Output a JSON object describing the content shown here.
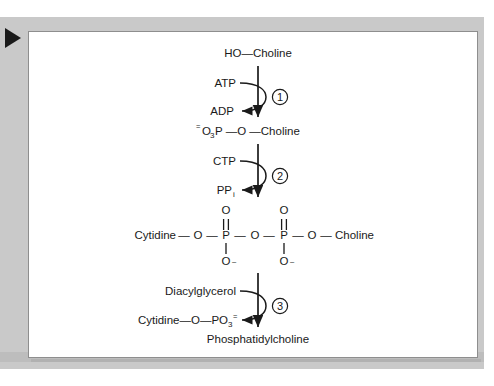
{
  "figure": {
    "marker": "play-triangle",
    "background_color": "#c9c9c9",
    "panel_color": "#ffffff",
    "ink_color": "#1a1a1a"
  },
  "pathway": {
    "title": "Phosphatidylcholine biosynthesis",
    "nodes": [
      {
        "id": "choline",
        "text": "HO—Choline"
      },
      {
        "id": "phosphocholine",
        "prefix_charge": "=",
        "text_main": "O",
        "sub": "3",
        "text_rest": "P —O —Choline"
      },
      {
        "id": "cdp_choline",
        "text": "Cytidine—O—P—O—P—O—Choline"
      },
      {
        "id": "product",
        "text": "Phosphatidylcholine"
      }
    ],
    "cdp_choline_atoms": {
      "left_label": "Cytidine",
      "bond1": "—",
      "o1": "O",
      "bond2": "—",
      "p1": "P",
      "bond3": "—",
      "o_bridge": "O",
      "bond4": "—",
      "p2": "P",
      "bond5": "—",
      "o2": "O",
      "bond6": "—",
      "right_label": "Choline",
      "p1_double_o": "O",
      "p2_double_o": "O",
      "p1_minus_o": "O",
      "p2_minus_o": "O",
      "minus_sign": "–"
    },
    "steps": [
      {
        "number": "1",
        "circle_glyph": "①",
        "substrate": "ATP",
        "product": "ADP"
      },
      {
        "number": "2",
        "circle_glyph": "②",
        "substrate": "CTP",
        "product": "PP",
        "product_sub": "i"
      },
      {
        "number": "3",
        "circle_glyph": "③",
        "substrate": "Diacylglycerol",
        "product_prefix": "Cytidine—O—PO",
        "product_sub": "3",
        "product_sup": "="
      }
    ]
  }
}
